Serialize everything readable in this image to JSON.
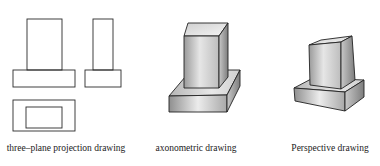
{
  "figure": {
    "panels": [
      {
        "id": "three-plane",
        "label": "three–plane projection drawing",
        "views": [
          "front-view",
          "side-view",
          "top-view"
        ]
      },
      {
        "id": "axonometric",
        "label": "axonometric drawing"
      },
      {
        "id": "perspective",
        "label": "Perspective drawing"
      }
    ],
    "colors": {
      "line": "#2a2a2a",
      "shade_light": "#f2f2f2",
      "shade_dark": "#8a8a8a",
      "background": "#ffffff"
    }
  }
}
